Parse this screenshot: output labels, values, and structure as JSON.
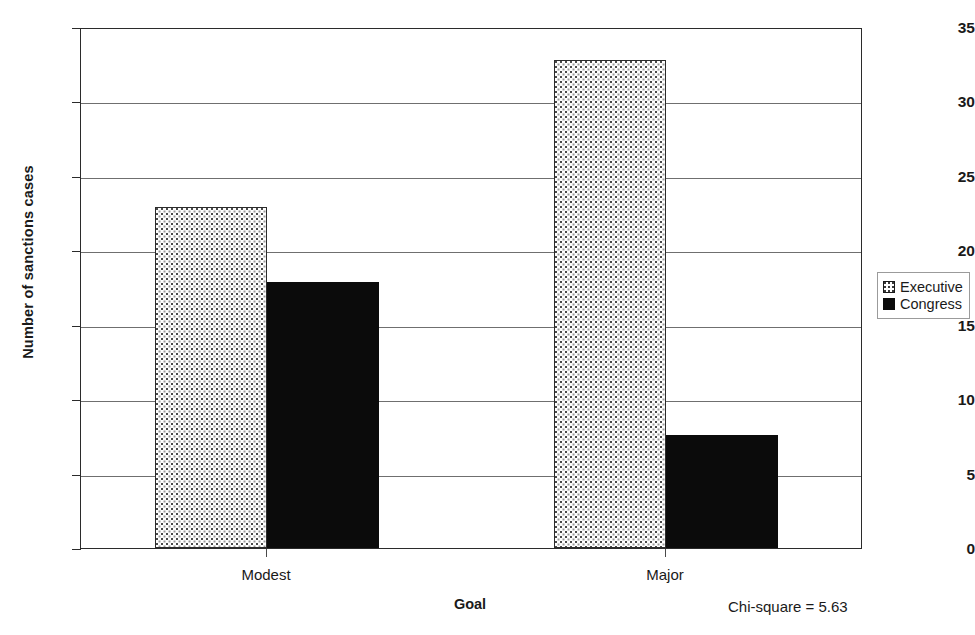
{
  "chart_data": {
    "type": "bar",
    "title": "",
    "xlabel": "Goal",
    "ylabel": "Number of sanctions cases",
    "categories": [
      "Modest",
      "Major"
    ],
    "series": [
      {
        "name": "Executive",
        "values": [
          22.9,
          32.8
        ],
        "pattern": "stipple",
        "color": "#e8e8e8"
      },
      {
        "name": "Congress",
        "values": [
          17.9,
          7.6
        ],
        "pattern": "solid",
        "color": "#0b0b0b"
      }
    ],
    "ylim": [
      0,
      35
    ],
    "yticks": [
      0,
      5,
      10,
      15,
      20,
      25,
      30,
      35
    ],
    "ytick_labels": [
      "0",
      "5",
      "10",
      "15",
      "20",
      "25",
      "30",
      "35"
    ],
    "grid": true,
    "grid_axis": "y",
    "legend_position": "right",
    "annotations": [
      {
        "text": "Chi-square = 5.63"
      }
    ]
  },
  "legend": {
    "entries": [
      {
        "label": "Executive",
        "swatch": "stipple-square-swatch"
      },
      {
        "label": "Congress",
        "swatch": "solid-black-square-swatch"
      }
    ]
  }
}
